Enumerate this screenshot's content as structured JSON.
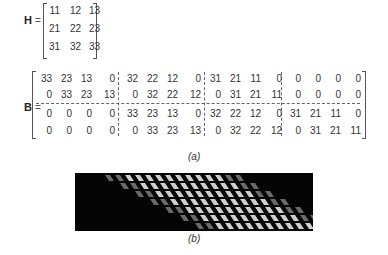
{
  "figure": {
    "H": {
      "label": "H",
      "equals": "=",
      "rows": [
        [
          "11",
          "12",
          "13"
        ],
        [
          "21",
          "22",
          "23"
        ],
        [
          "31",
          "32",
          "33"
        ]
      ]
    },
    "B": {
      "label": "B",
      "equals": "=",
      "rows": [
        [
          "33",
          "23",
          "13",
          "0",
          "32",
          "22",
          "12",
          "0",
          "31",
          "21",
          "11",
          "0",
          "0",
          "0",
          "0",
          "0"
        ],
        [
          "0",
          "33",
          "23",
          "13",
          "0",
          "32",
          "22",
          "12",
          "0",
          "31",
          "21",
          "11",
          "0",
          "0",
          "0",
          "0"
        ],
        [
          "0",
          "0",
          "0",
          "0",
          "33",
          "23",
          "13",
          "0",
          "32",
          "22",
          "12",
          "0",
          "31",
          "21",
          "11",
          "0"
        ],
        [
          "0",
          "0",
          "0",
          "0",
          "0",
          "33",
          "23",
          "13",
          "0",
          "32",
          "22",
          "12",
          "0",
          "31",
          "21",
          "11"
        ]
      ],
      "block_partition": {
        "column_blocks": 4,
        "row_blocks": 2,
        "block_size": "2x4"
      }
    },
    "caption_a": "(a)",
    "caption_b": "(b)",
    "image_b": {
      "description": "Grayscale image of the block-circulant matrix B: black background with diagonal band of bright slanted blocks",
      "background_color": "#050505",
      "band_color": "#e6e6e6"
    }
  }
}
